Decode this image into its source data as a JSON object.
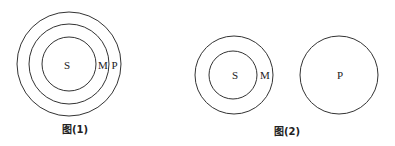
{
  "figure1": {
    "caption": "图(1)",
    "labels": {
      "inner": "S",
      "middle": "M",
      "outer": "P"
    }
  },
  "figure2": {
    "caption": "图(2)",
    "labels": {
      "inner": "S",
      "outer": "M",
      "separate": "P"
    }
  },
  "colors": {
    "stroke": "#333333",
    "background": "#ffffff"
  }
}
